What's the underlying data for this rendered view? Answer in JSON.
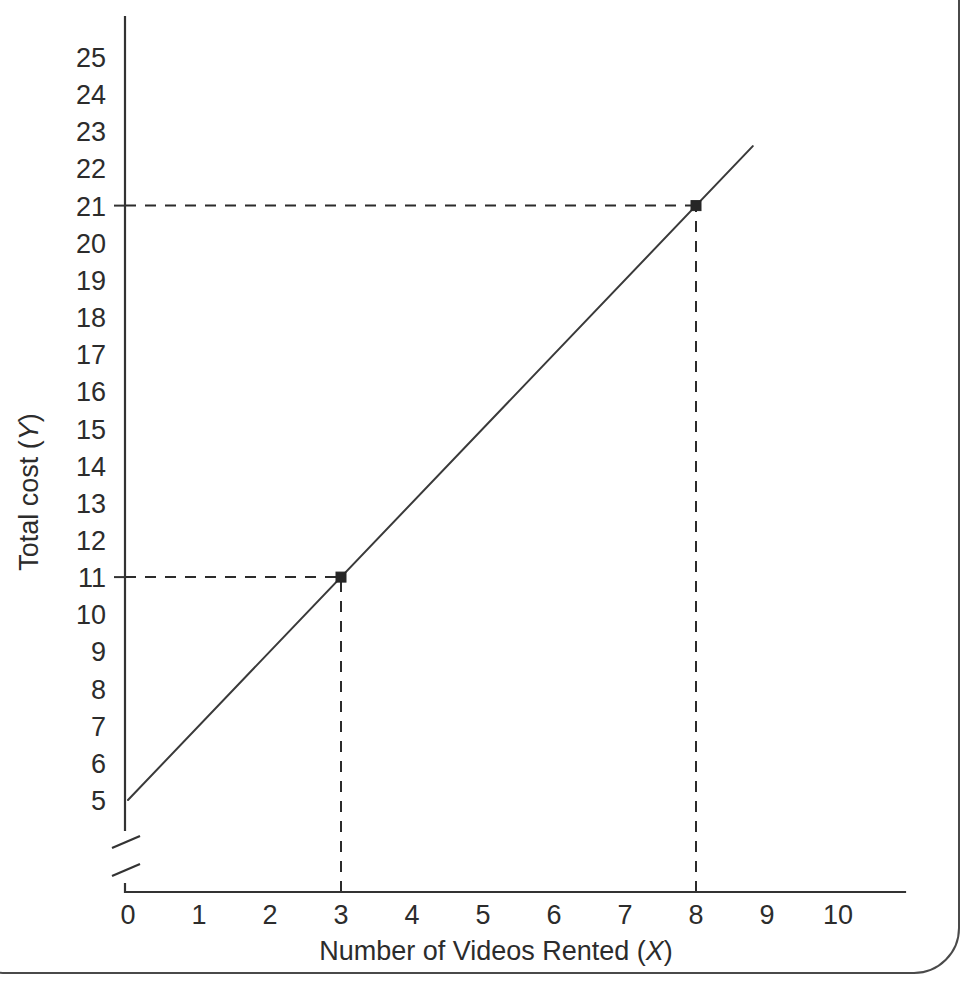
{
  "figure": {
    "name": "total-cost-vs-videos-rented-line-graph",
    "border_color": "#4a4a4a",
    "background": "#ffffff",
    "line_color": "#3a3a3a",
    "guide_color": "#2b2b2b",
    "axis_color": "#333333"
  },
  "chart_data": {
    "type": "line",
    "title": "",
    "xlabel": "Number of Videos Rented (",
    "xlabel_var": "X",
    "xlabel_tail": ")",
    "ylabel": "Total cost (",
    "ylabel_var": "Y",
    "ylabel_tail": ")",
    "x": [
      0,
      8.8
    ],
    "y": [
      5,
      22.6
    ],
    "equation_intercept": 5,
    "equation_slope": 2,
    "xlim": [
      0,
      10
    ],
    "ylim": [
      5,
      25.6
    ],
    "y_axis_break": true,
    "y_axis_break_note": "zigzag break between 0 and 5",
    "grid": false,
    "legend": null,
    "xticks": [
      0,
      1,
      2,
      3,
      4,
      5,
      6,
      7,
      8,
      9,
      10
    ],
    "xticklabels": [
      "0",
      "1",
      "2",
      "3",
      "4",
      "5",
      "6",
      "7",
      "8",
      "9",
      "10"
    ],
    "yticks": [
      5,
      6,
      7,
      8,
      9,
      10,
      11,
      12,
      13,
      14,
      15,
      16,
      17,
      18,
      19,
      20,
      21,
      22,
      23,
      24,
      25
    ],
    "yticklabels": [
      "5",
      "6",
      "7",
      "8",
      "9",
      "10",
      "11",
      "12",
      "13",
      "14",
      "15",
      "16",
      "17",
      "18",
      "19",
      "20",
      "21",
      "22",
      "23",
      "24",
      "25"
    ],
    "annotated_points": [
      {
        "name": "point-3-11",
        "x": 3,
        "y": 11,
        "label": "(3, 11)"
      },
      {
        "name": "point-8-21",
        "x": 8,
        "y": 21,
        "label": "(8, 21)"
      }
    ],
    "guide_lines": [
      {
        "name": "guide-horizontal-11",
        "from_x": 0,
        "to_x": 3,
        "y": 11
      },
      {
        "name": "guide-vertical-3",
        "x": 3,
        "from_y": 5,
        "to_y": 11
      },
      {
        "name": "guide-horizontal-21",
        "from_x": 0,
        "to_x": 8,
        "y": 21
      },
      {
        "name": "guide-vertical-8",
        "x": 8,
        "from_y": 5,
        "to_y": 21
      }
    ]
  }
}
